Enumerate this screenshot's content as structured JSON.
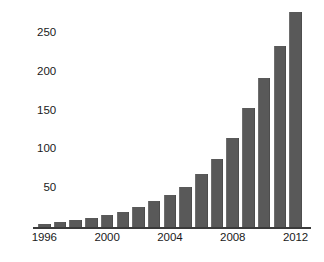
{
  "chart_data": {
    "type": "bar",
    "title": "",
    "subtitle": "",
    "xlabel": "",
    "ylabel": "",
    "categories": [
      "1996",
      "1997",
      "1998",
      "1999",
      "2000",
      "2001",
      "2002",
      "2003",
      "2004",
      "2005",
      "2006",
      "2007",
      "2008",
      "2009",
      "2010",
      "2011",
      "2012"
    ],
    "values": [
      4,
      6,
      9,
      12,
      16,
      20,
      26,
      34,
      41,
      52,
      68,
      88,
      115,
      153,
      192,
      233,
      278
    ],
    "series": [
      {
        "name": "",
        "values": [
          4,
          6,
          9,
          12,
          16,
          20,
          26,
          34,
          41,
          52,
          68,
          88,
          115,
          153,
          192,
          233,
          278
        ]
      }
    ],
    "x_tick_labels": [
      "1996",
      "2000",
      "2004",
      "2008",
      "2012"
    ],
    "x_tick_categories": [
      "1996",
      "2000",
      "2004",
      "2008",
      "2012"
    ],
    "y_tick_labels": [
      "50",
      "100",
      "150",
      "200",
      "250"
    ],
    "y_tick_values": [
      50,
      100,
      150,
      200,
      250
    ],
    "ylim": [
      0,
      290
    ],
    "xlim": [
      1995.5,
      2012.5
    ],
    "grid": false,
    "legend": "none",
    "bar_color": "#595959",
    "axis_color": "#3a3a3a",
    "background_color": "#ffffff",
    "text_color": "#1a1a1a"
  }
}
